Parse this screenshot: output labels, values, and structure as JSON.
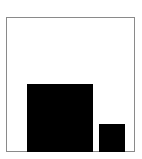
{
  "diagram": {
    "frame": {
      "stroke_color": "#8a8a8a",
      "fill_color": "#ffffff"
    },
    "shapes": [
      {
        "id": "large-square",
        "fill": "#000000"
      },
      {
        "id": "small-square",
        "fill": "#000000"
      }
    ]
  }
}
